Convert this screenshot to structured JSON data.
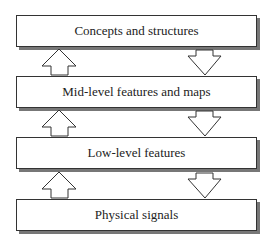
{
  "diagram": {
    "levels": [
      {
        "label": "Concepts and structures"
      },
      {
        "label": "Mid-level features and maps"
      },
      {
        "label": "Low-level features"
      },
      {
        "label": "Physical signals"
      }
    ],
    "arrows": {
      "left": "up",
      "right": "down"
    }
  }
}
